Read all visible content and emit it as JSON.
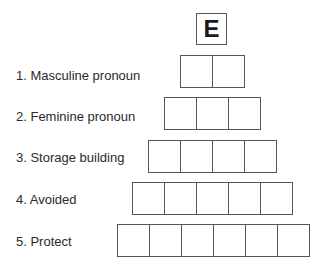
{
  "puzzle": {
    "start_letter": "E",
    "clues": [
      {
        "label": "1. Masculine pronoun",
        "length": 2
      },
      {
        "label": "2. Feminine pronoun",
        "length": 3
      },
      {
        "label": "3. Storage building",
        "length": 4
      },
      {
        "label": "4. Avoided",
        "length": 5
      },
      {
        "label": "5. Protect",
        "length": 6
      }
    ]
  }
}
